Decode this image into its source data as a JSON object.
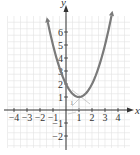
{
  "chart_data": {
    "type": "line",
    "title": "",
    "xlabel": "x",
    "ylabel": "y",
    "xlim": [
      -4.5,
      4.8
    ],
    "ylim": [
      -2.9,
      7.2
    ],
    "grid": true,
    "x_ticks": [
      -4,
      -3,
      -2,
      -1,
      1,
      2,
      3,
      4
    ],
    "y_ticks": [
      -2,
      -1,
      1,
      2,
      3,
      4,
      5,
      6
    ],
    "x_tick_labels": [
      "−4",
      "−3",
      "−2",
      "−1",
      "1",
      "2",
      "3",
      "4"
    ],
    "y_tick_labels": [
      "−2",
      "−1",
      "1",
      "2",
      "3",
      "4",
      "5",
      "6"
    ],
    "series": [
      {
        "name": "parabola",
        "equation": "y = (x − 1)^2 + 1",
        "color": "#7a7a7a",
        "x": [
          -1.4,
          -1,
          0,
          0.5,
          1,
          1.5,
          2,
          3,
          3.5
        ],
        "y": [
          6.76,
          5,
          2,
          1.25,
          1,
          1.25,
          2,
          5,
          7.25
        ],
        "arrows_at_ends": true
      }
    ],
    "annotations": [
      {
        "text": "1",
        "x": 0.75,
        "y": 0.5,
        "note": "slope marker near vertex"
      },
      {
        "text": "vertex",
        "x": 1,
        "y": 1,
        "note": "crossing guide lines at vertex"
      }
    ]
  },
  "labels": {
    "x_axis": "x",
    "y_axis": "y",
    "vertex_mark": "1"
  },
  "colors": {
    "curve": "#7a7a7a",
    "axis": "#333333",
    "grid": "#e3e3e3",
    "guide": "#b5b5b5"
  }
}
